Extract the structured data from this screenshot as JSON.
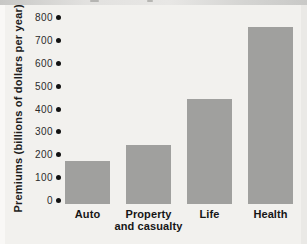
{
  "colors": {
    "panel_bg": "#f2f1ee",
    "bar": "#a0a09e",
    "tick_dot": "#121212",
    "text": "#1c1c1c",
    "top_strip": "#d0d0ce"
  },
  "chart_data": {
    "type": "bar",
    "categories": [
      "Auto",
      "Property and casualty",
      "Life",
      "Health"
    ],
    "category_lines": [
      [
        "Auto"
      ],
      [
        "Property",
        "and casualty"
      ],
      [
        "Life"
      ],
      [
        "Health"
      ]
    ],
    "values": [
      190,
      260,
      460,
      775
    ],
    "xlabel": "",
    "ylabel": "Premiums (billions of dollars per year)",
    "ylim": [
      0,
      800
    ],
    "yticks": [
      0,
      100,
      200,
      300,
      400,
      500,
      600,
      700,
      800
    ],
    "ytick_marker": "filled-dot",
    "grid": false,
    "legend": "none",
    "bar_color": "#a0a09e"
  }
}
